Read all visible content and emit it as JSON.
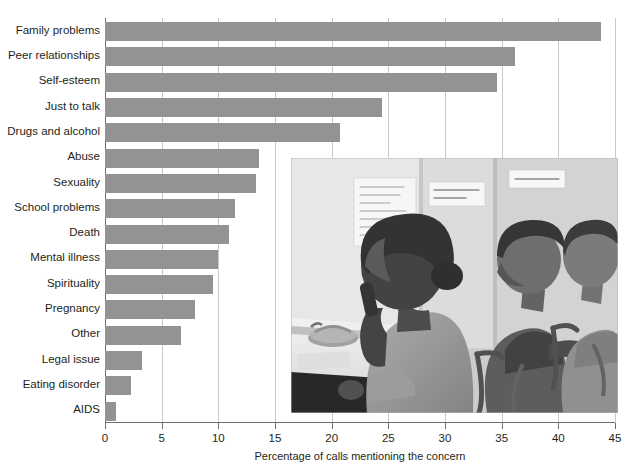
{
  "chart_data": {
    "type": "bar",
    "orientation": "horizontal",
    "title": "",
    "xlabel": "Percentage of calls mentioning the concern",
    "ylabel": "",
    "xlim": [
      0,
      45
    ],
    "xticks": [
      0,
      5,
      10,
      15,
      20,
      25,
      30,
      35,
      40,
      45
    ],
    "grid": "vertical",
    "legend": "none",
    "bar_color": "#939393",
    "categories": [
      "Family problems",
      "Peer relationships",
      "Self-esteem",
      "Just to talk",
      "Drugs and alcohol",
      "Abuse",
      "Sexuality",
      "School problems",
      "Death",
      "Mental illness",
      "Spirituality",
      "Pregnancy",
      "Other",
      "Legal issue",
      "Eating disorder",
      "AIDS"
    ],
    "values": [
      43.8,
      36.2,
      34.6,
      24.4,
      20.7,
      13.6,
      13.3,
      11.5,
      10.9,
      10.0,
      9.5,
      7.9,
      6.7,
      3.3,
      2.3,
      1.0
    ]
  },
  "axis": {
    "x_title": "Percentage of calls mentioning the concern",
    "tick_labels": [
      "0",
      "5",
      "10",
      "15",
      "20",
      "25",
      "30",
      "35",
      "40",
      "45"
    ]
  },
  "inset_photo": {
    "name": "crisis-hotline-photograph",
    "description": "Black and white photograph of three teenagers seated at a crisis hotline call center; foreground girl speaks on a telephone at a desk",
    "poster_left_text": "Please join you, share the days, hold then you, find things that change, love yourself",
    "poster_middle_text": "LISTEN WITH LOVE! SAVE A LIFE!",
    "poster_right_text": "SPEAK OUT LOUD"
  }
}
